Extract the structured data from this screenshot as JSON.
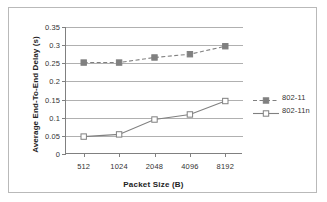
{
  "chart_data": {
    "type": "line",
    "title": "",
    "xlabel": "Packet Size (B)",
    "ylabel": "Average End-To-End  Delay (s)",
    "categories": [
      "512",
      "1024",
      "2048",
      "4096",
      "8192"
    ],
    "ylim": [
      0,
      0.35
    ],
    "yticks": [
      "0",
      "0.05",
      "0.1",
      "0.15",
      "0.2",
      "0.25",
      "0.3",
      "0.35"
    ],
    "ytick_values": [
      0,
      0.05,
      0.1,
      0.15,
      0.2,
      0.25,
      0.3,
      0.35
    ],
    "grid": true,
    "legend_position": "right",
    "series": [
      {
        "name": "802-11",
        "values": [
          0.252,
          0.252,
          0.266,
          0.275,
          0.297
        ],
        "color": "#808080",
        "linestyle": "dashed",
        "marker": "filled-square"
      },
      {
        "name": "802-11n",
        "values": [
          0.048,
          0.054,
          0.095,
          0.109,
          0.146
        ],
        "color": "#808080",
        "linestyle": "solid",
        "marker": "open-square"
      }
    ]
  },
  "legend": {
    "items": [
      {
        "label": "802-11"
      },
      {
        "label": "802-11n"
      }
    ]
  },
  "colors": {
    "series": "#808080",
    "gridline": "#b0b0b0",
    "axis": "#808080",
    "text": "#333333",
    "frame": "#b9b9b9",
    "background": "#ffffff"
  }
}
